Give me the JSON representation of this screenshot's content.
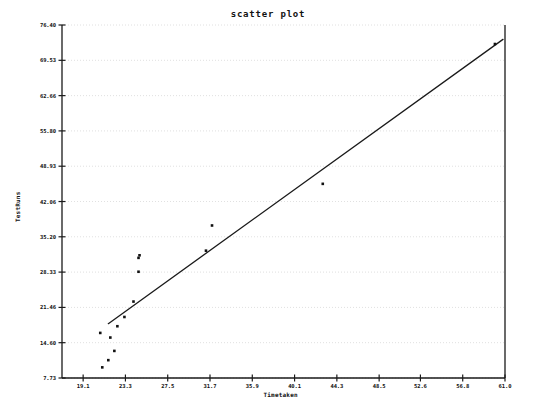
{
  "chart_data": {
    "type": "scatter",
    "title": "scatter plot",
    "xlabel": "Timetaken",
    "ylabel": "TestRuns",
    "grid": true,
    "grid_orientation": "horizontal",
    "legend": "none",
    "xlim": [
      17.0,
      61.0
    ],
    "ylim": [
      7.73,
      76.4
    ],
    "xticks": [
      "19.1",
      "23.3",
      "27.5",
      "31.7",
      "35.9",
      "40.1",
      "44.3",
      "48.5",
      "52.6",
      "56.8",
      "61.0"
    ],
    "xtick_values": [
      19.1,
      23.3,
      27.5,
      31.7,
      35.9,
      40.1,
      44.3,
      48.5,
      52.6,
      56.8,
      61.0
    ],
    "yticks": [
      "76.40",
      "69.53",
      "62.66",
      "55.80",
      "48.93",
      "42.06",
      "35.20",
      "28.33",
      "21.46",
      "14.60",
      "7.73"
    ],
    "ytick_values": [
      76.4,
      69.53,
      62.66,
      55.8,
      48.93,
      42.06,
      35.2,
      28.33,
      21.46,
      14.6,
      7.73
    ],
    "points": [
      {
        "x": 21.0,
        "y": 9.8
      },
      {
        "x": 21.6,
        "y": 11.2
      },
      {
        "x": 22.2,
        "y": 13.0
      },
      {
        "x": 21.8,
        "y": 15.6
      },
      {
        "x": 20.8,
        "y": 16.5
      },
      {
        "x": 22.5,
        "y": 17.8
      },
      {
        "x": 23.2,
        "y": 19.6
      },
      {
        "x": 24.1,
        "y": 22.6
      },
      {
        "x": 24.6,
        "y": 28.4
      },
      {
        "x": 24.6,
        "y": 31.1
      },
      {
        "x": 24.7,
        "y": 31.6
      },
      {
        "x": 31.3,
        "y": 32.5
      },
      {
        "x": 31.9,
        "y": 37.4
      },
      {
        "x": 42.9,
        "y": 45.5
      },
      {
        "x": 60.0,
        "y": 72.7
      }
    ],
    "trendline": {
      "label": "linear fit",
      "x_start": 21.6,
      "y_start": 18.3,
      "x_end": 60.8,
      "y_end": 73.6
    },
    "colors": {
      "marker": "#111111",
      "line": "#1a1a1a",
      "axis": "#1a1a1a",
      "grid": "#d8d8d8",
      "background": "#ffffff",
      "text": "#111111"
    },
    "plot_area": {
      "left": 62,
      "top": 25,
      "right": 505,
      "bottom": 378
    }
  }
}
